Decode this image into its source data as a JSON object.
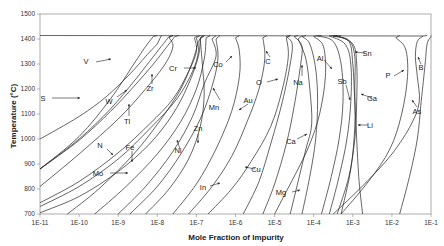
{
  "chart_data": {
    "type": "line",
    "title": "",
    "xlabel": "Mole Fraction of Impurity",
    "ylabel": "Temperature (°C)",
    "xscale": "log",
    "xlim": [
      1e-11,
      0.1
    ],
    "ylim": [
      700,
      1500
    ],
    "x_ticks": [
      "1E-11",
      "1E-10",
      "1E-9",
      "1E-8",
      "1E-7",
      "1E-6",
      "1E-5",
      "1E-4",
      "1E-3",
      "1E-2",
      "1E-1"
    ],
    "y_ticks": [
      "700",
      "800",
      "900",
      "1000",
      "1100",
      "1200",
      "1300",
      "1400",
      "1500"
    ],
    "grid": false,
    "legend": "none (curves labeled inline with arrows)",
    "melting_point_C": 1414,
    "series": [
      {
        "name": "S",
        "points": [
          [
            -11,
            1000
          ],
          [
            -10,
            1090
          ],
          [
            -9.3,
            1170
          ],
          [
            -8.7,
            1260
          ],
          [
            -8.3,
            1330
          ],
          [
            -8.0,
            1380
          ]
        ]
      },
      {
        "name": "V",
        "points": [
          [
            -11,
            880
          ],
          [
            -10,
            1010
          ],
          [
            -9.2,
            1160
          ],
          [
            -8.6,
            1300
          ],
          [
            -8.3,
            1370
          ],
          [
            -8.1,
            1410
          ]
        ]
      },
      {
        "name": "W",
        "points": [
          [
            -11,
            880
          ],
          [
            -10,
            1000
          ],
          [
            -9.2,
            1120
          ],
          [
            -8.6,
            1230
          ],
          [
            -8.2,
            1310
          ],
          [
            -7.9,
            1370
          ],
          [
            -7.7,
            1410
          ]
        ]
      },
      {
        "name": "Ti",
        "points": [
          [
            -11,
            880
          ],
          [
            -10,
            995
          ],
          [
            -9.2,
            1110
          ],
          [
            -8.6,
            1210
          ],
          [
            -8.1,
            1300
          ],
          [
            -7.7,
            1380
          ],
          [
            -7.55,
            1410
          ]
        ]
      },
      {
        "name": "Zr",
        "points": [
          [
            -11,
            810
          ],
          [
            -10,
            940
          ],
          [
            -9.0,
            1080
          ],
          [
            -8.3,
            1200
          ],
          [
            -7.8,
            1300
          ],
          [
            -7.6,
            1370
          ],
          [
            -7.7,
            1405
          ]
        ]
      },
      {
        "name": "N",
        "points": [
          [
            -11,
            745
          ],
          [
            -10,
            830
          ],
          [
            -9,
            945
          ],
          [
            -8.2,
            1060
          ],
          [
            -7.6,
            1160
          ],
          [
            -7.2,
            1270
          ],
          [
            -7.0,
            1350
          ],
          [
            -7.05,
            1405
          ]
        ]
      },
      {
        "name": "Fe",
        "points": [
          [
            -11,
            730
          ],
          [
            -10,
            810
          ],
          [
            -9,
            920
          ],
          [
            -8.2,
            1040
          ],
          [
            -7.5,
            1160
          ],
          [
            -7.1,
            1270
          ],
          [
            -6.95,
            1350
          ],
          [
            -7.0,
            1405
          ]
        ]
      },
      {
        "name": "Cr",
        "points": [
          [
            -10.3,
            700
          ],
          [
            -9.5,
            800
          ],
          [
            -8.6,
            940
          ],
          [
            -7.9,
            1080
          ],
          [
            -7.4,
            1200
          ],
          [
            -7.1,
            1310
          ],
          [
            -6.95,
            1390
          ]
        ]
      },
      {
        "name": "Mo",
        "points": [
          [
            -11,
            705
          ],
          [
            -10,
            770
          ],
          [
            -9,
            870
          ],
          [
            -8.2,
            980
          ],
          [
            -7.6,
            1100
          ],
          [
            -7.2,
            1220
          ],
          [
            -6.95,
            1330
          ],
          [
            -6.9,
            1405
          ]
        ]
      },
      {
        "name": "Ni",
        "points": [
          [
            -9.6,
            700
          ],
          [
            -8.8,
            810
          ],
          [
            -8.0,
            940
          ],
          [
            -7.4,
            1070
          ],
          [
            -7.0,
            1200
          ],
          [
            -6.8,
            1320
          ],
          [
            -6.75,
            1405
          ]
        ]
      },
      {
        "name": "Co",
        "points": [
          [
            -9.0,
            700
          ],
          [
            -8.3,
            810
          ],
          [
            -7.6,
            950
          ],
          [
            -7.1,
            1090
          ],
          [
            -6.8,
            1220
          ],
          [
            -6.5,
            1330
          ],
          [
            -6.6,
            1400
          ]
        ]
      },
      {
        "name": "Zn",
        "points": [
          [
            -8.7,
            700
          ],
          [
            -8.0,
            810
          ],
          [
            -7.4,
            940
          ],
          [
            -6.9,
            1080
          ],
          [
            -6.6,
            1210
          ],
          [
            -6.45,
            1320
          ],
          [
            -6.5,
            1400
          ]
        ]
      },
      {
        "name": "Mn",
        "points": [
          [
            -8.3,
            700
          ],
          [
            -7.7,
            800
          ],
          [
            -7.2,
            920
          ],
          [
            -6.9,
            1050
          ],
          [
            -6.8,
            1180
          ],
          [
            -6.85,
            1300
          ],
          [
            -6.9,
            1400
          ]
        ]
      },
      {
        "name": "Au",
        "points": [
          [
            -7.6,
            700
          ],
          [
            -7.0,
            820
          ],
          [
            -6.5,
            960
          ],
          [
            -6.1,
            1110
          ],
          [
            -5.9,
            1250
          ],
          [
            -5.9,
            1350
          ],
          [
            -6.0,
            1405
          ]
        ]
      },
      {
        "name": "In",
        "points": [
          [
            -7.2,
            700
          ],
          [
            -6.6,
            810
          ],
          [
            -6.1,
            930
          ],
          [
            -5.7,
            1070
          ],
          [
            -5.4,
            1200
          ],
          [
            -5.25,
            1320
          ],
          [
            -5.3,
            1405
          ]
        ]
      },
      {
        "name": "Cu",
        "points": [
          [
            -6.7,
            700
          ],
          [
            -6.1,
            800
          ],
          [
            -5.6,
            910
          ],
          [
            -5.1,
            1050
          ],
          [
            -4.8,
            1200
          ],
          [
            -4.65,
            1330
          ],
          [
            -4.7,
            1405
          ]
        ]
      },
      {
        "name": "C",
        "points": [
          [
            -5.8,
            700
          ],
          [
            -5.4,
            830
          ],
          [
            -5.1,
            980
          ],
          [
            -4.8,
            1150
          ],
          [
            -4.6,
            1300
          ],
          [
            -4.55,
            1380
          ],
          [
            -4.7,
            1410
          ]
        ]
      },
      {
        "name": "O",
        "points": [
          [
            -5.3,
            700
          ],
          [
            -5.0,
            820
          ],
          [
            -4.7,
            980
          ],
          [
            -4.5,
            1130
          ],
          [
            -4.35,
            1280
          ],
          [
            -4.3,
            1370
          ],
          [
            -4.5,
            1410
          ]
        ]
      },
      {
        "name": "Mg",
        "points": [
          [
            -5.0,
            700
          ],
          [
            -4.7,
            790
          ],
          [
            -4.4,
            880
          ],
          [
            -4.1,
            980
          ],
          [
            -3.85,
            1100
          ],
          [
            -3.7,
            1250
          ],
          [
            -3.75,
            1370
          ],
          [
            -4.0,
            1410
          ]
        ]
      },
      {
        "name": "Ca",
        "points": [
          [
            -4.6,
            700
          ],
          [
            -4.4,
            830
          ],
          [
            -4.2,
            960
          ],
          [
            -4.05,
            1060
          ],
          [
            -4.1,
            1200
          ],
          [
            -4.2,
            1320
          ],
          [
            -4.4,
            1400
          ]
        ]
      },
      {
        "name": "Na",
        "points": [
          [
            -4.3,
            700
          ],
          [
            -4.1,
            850
          ],
          [
            -3.95,
            1000
          ],
          [
            -3.9,
            1150
          ],
          [
            -3.95,
            1280
          ],
          [
            -4.1,
            1380
          ],
          [
            -4.3,
            1410
          ]
        ]
      },
      {
        "name": "Al",
        "points": [
          [
            -3.8,
            700
          ],
          [
            -3.55,
            850
          ],
          [
            -3.35,
            1000
          ],
          [
            -3.25,
            1150
          ],
          [
            -3.3,
            1300
          ],
          [
            -3.5,
            1390
          ],
          [
            -3.9,
            1412
          ]
        ]
      },
      {
        "name": "Sb",
        "points": [
          [
            -3.6,
            700
          ],
          [
            -3.35,
            850
          ],
          [
            -3.15,
            1000
          ],
          [
            -3.05,
            1150
          ],
          [
            -3.05,
            1300
          ],
          [
            -3.2,
            1380
          ],
          [
            -3.6,
            1412
          ]
        ]
      },
      {
        "name": "Ga",
        "points": [
          [
            -3.4,
            700
          ],
          [
            -3.1,
            850
          ],
          [
            -2.95,
            1000
          ],
          [
            -2.9,
            1150
          ],
          [
            -2.9,
            1300
          ],
          [
            -3.0,
            1380
          ],
          [
            -3.4,
            1412
          ]
        ]
      },
      {
        "name": "Li",
        "points": [
          [
            -3.3,
            700
          ],
          [
            -3.05,
            880
          ],
          [
            -2.95,
            1050
          ],
          [
            -2.95,
            1200
          ],
          [
            -2.95,
            1330
          ],
          [
            -3.1,
            1395
          ],
          [
            -3.5,
            1412
          ]
        ]
      },
      {
        "name": "Sn",
        "points": [
          [
            -2.75,
            700
          ],
          [
            -2.85,
            850
          ],
          [
            -2.9,
            1000
          ],
          [
            -2.95,
            1150
          ],
          [
            -3.0,
            1300
          ],
          [
            -3.1,
            1390
          ],
          [
            -3.5,
            1412
          ]
        ]
      },
      {
        "name": "P",
        "points": [
          [
            -3.3,
            700
          ],
          [
            -2.6,
            830
          ],
          [
            -2.05,
            960
          ],
          [
            -1.75,
            1100
          ],
          [
            -1.6,
            1250
          ],
          [
            -1.65,
            1360
          ],
          [
            -1.9,
            1405
          ]
        ]
      },
      {
        "name": "As",
        "points": [
          [
            -3.5,
            700
          ],
          [
            -2.7,
            820
          ],
          [
            -2.0,
            940
          ],
          [
            -1.5,
            1060
          ],
          [
            -1.3,
            1150
          ],
          [
            -1.35,
            1250
          ],
          [
            -1.4,
            1330
          ],
          [
            -1.35,
            1390
          ],
          [
            -1.2,
            1412
          ]
        ]
      },
      {
        "name": "B",
        "points": [
          [
            -1.8,
            700
          ],
          [
            -1.55,
            850
          ],
          [
            -1.35,
            1000
          ],
          [
            -1.25,
            1150
          ],
          [
            -1.15,
            1300
          ],
          [
            -1.1,
            1380
          ],
          [
            -1.0,
            1410
          ]
        ]
      }
    ],
    "annotations": [
      "S",
      "V",
      "W",
      "Ti",
      "Zr",
      "N",
      "Fe",
      "Mo",
      "Cr",
      "Ni",
      "Zn",
      "Co",
      "Mn",
      "Au",
      "In",
      "Cu",
      "C",
      "O",
      "Na",
      "Ca",
      "Mg",
      "Al",
      "Sb",
      "Ga",
      "Li",
      "Sn",
      "P",
      "B",
      "As"
    ]
  },
  "labels": [
    {
      "text": "V",
      "x": 86,
      "y": 64,
      "ax": [
        96,
        62,
        111,
        59
      ]
    },
    {
      "text": "S",
      "x": 43,
      "y": 101,
      "ax": [
        52,
        98,
        80,
        98
      ]
    },
    {
      "text": "W",
      "x": 109,
      "y": 104,
      "ax": [
        117,
        97,
        127,
        90
      ]
    },
    {
      "text": "Zr",
      "x": 150,
      "y": 91,
      "ax": [
        152,
        84,
        152,
        74
      ]
    },
    {
      "text": "Tl",
      "x": 127,
      "y": 124,
      "ax": [
        129,
        116,
        129,
        104
      ]
    },
    {
      "text": "Cr",
      "x": 173,
      "y": 71,
      "ax": [
        184,
        68,
        196,
        68
      ]
    },
    {
      "text": "Co",
      "x": 218,
      "y": 67,
      "ax": [
        226,
        62,
        232,
        56
      ]
    },
    {
      "text": "Mn",
      "x": 214,
      "y": 110,
      "ax": [
        220,
        100,
        213,
        88
      ]
    },
    {
      "text": "Au",
      "x": 248,
      "y": 103,
      "ax": [
        248,
        104,
        239,
        110
      ]
    },
    {
      "text": "C",
      "x": 268,
      "y": 64,
      "ax": [
        270,
        57,
        266,
        51
      ]
    },
    {
      "text": "O",
      "x": 259,
      "y": 85,
      "ax": [
        267,
        82,
        278,
        79
      ]
    },
    {
      "text": "Na",
      "x": 298,
      "y": 85,
      "ax": [
        302,
        76,
        302,
        65
      ]
    },
    {
      "text": "Al",
      "x": 320,
      "y": 61,
      "ax": [
        324,
        60,
        332,
        69
      ]
    },
    {
      "text": "Sn",
      "x": 367,
      "y": 56,
      "ax": [
        365,
        53,
        355,
        52
      ]
    },
    {
      "text": "Sb",
      "x": 342,
      "y": 84,
      "ax": [
        346,
        85,
        350,
        100
      ]
    },
    {
      "text": "Ga",
      "x": 372,
      "y": 101,
      "ax": [
        372,
        98,
        361,
        94
      ]
    },
    {
      "text": "P",
      "x": 388,
      "y": 78,
      "ax": [
        394,
        76,
        404,
        70
      ]
    },
    {
      "text": "B",
      "x": 421,
      "y": 70,
      "ax": [
        421,
        64,
        418,
        57
      ]
    },
    {
      "text": "As",
      "x": 417,
      "y": 114,
      "ax": [
        417,
        107,
        412,
        100
      ]
    },
    {
      "text": "Li",
      "x": 370,
      "y": 128,
      "ax": [
        368,
        125,
        358,
        125
      ]
    },
    {
      "text": "Ca",
      "x": 291,
      "y": 144,
      "ax": [
        297,
        139,
        307,
        134
      ]
    },
    {
      "text": "N",
      "x": 100,
      "y": 148,
      "ax": [
        107,
        149,
        113,
        155
      ]
    },
    {
      "text": "Fe",
      "x": 130,
      "y": 150,
      "ax": [
        132,
        151,
        132,
        162
      ]
    },
    {
      "text": "Ni",
      "x": 178,
      "y": 153,
      "ax": [
        180,
        149,
        177,
        140
      ]
    },
    {
      "text": "Zn",
      "x": 198,
      "y": 131,
      "ax": [
        198,
        134,
        198,
        143
      ]
    },
    {
      "text": "Mo",
      "x": 98,
      "y": 176,
      "ax": [
        110,
        173,
        128,
        173
      ]
    },
    {
      "text": "Cu",
      "x": 256,
      "y": 172,
      "ax": [
        255,
        169,
        245,
        167
      ]
    },
    {
      "text": "In",
      "x": 203,
      "y": 190,
      "ax": [
        210,
        186,
        220,
        183
      ]
    },
    {
      "text": "Mg",
      "x": 281,
      "y": 195,
      "ax": [
        292,
        192,
        300,
        190
      ]
    }
  ]
}
